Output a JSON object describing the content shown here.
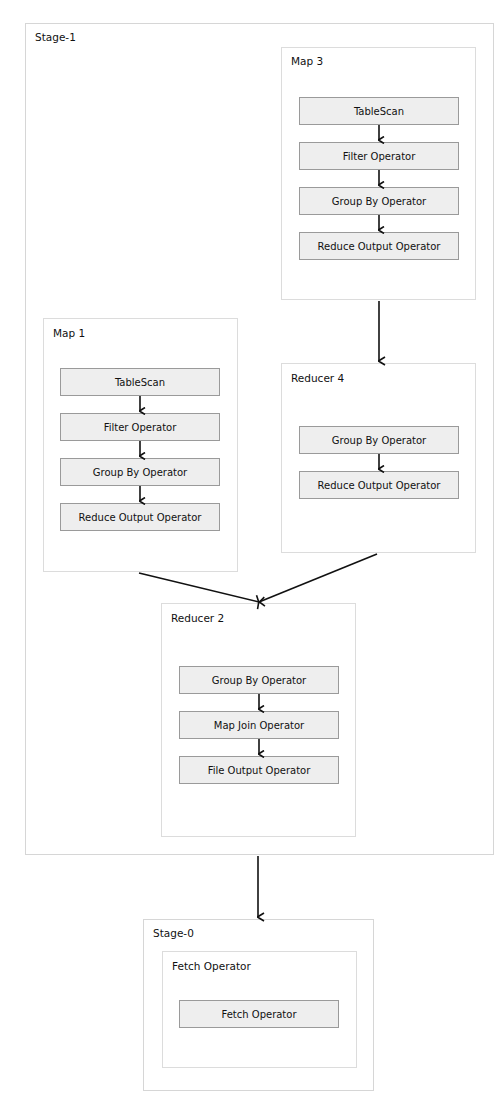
{
  "stages": {
    "stage1": {
      "label": "Stage-1",
      "vertices": {
        "map3": {
          "label": "Map 3",
          "operators": [
            "TableScan",
            "Filter Operator",
            "Group By Operator",
            "Reduce Output Operator"
          ]
        },
        "map1": {
          "label": "Map 1",
          "operators": [
            "TableScan",
            "Filter Operator",
            "Group By Operator",
            "Reduce Output Operator"
          ]
        },
        "reducer4": {
          "label": "Reducer 4",
          "operators": [
            "Group By Operator",
            "Reduce Output Operator"
          ]
        },
        "reducer2": {
          "label": "Reducer 2",
          "operators": [
            "Group By Operator",
            "Map Join Operator",
            "File Output Operator"
          ]
        }
      }
    },
    "stage0": {
      "label": "Stage-0",
      "vertices": {
        "fetch": {
          "label": "Fetch Operator",
          "operators": [
            "Fetch Operator"
          ]
        }
      }
    }
  },
  "edges": [
    {
      "from": "Map 3",
      "to": "Reducer 4"
    },
    {
      "from": "Map 1",
      "to": "Reducer 2"
    },
    {
      "from": "Reducer 4",
      "to": "Reducer 2"
    },
    {
      "from": "Stage-1",
      "to": "Stage-0"
    }
  ],
  "colors": {
    "operator_fill": "#eeeeee",
    "operator_border": "#9a9a9a",
    "container_border": "#dcdcdc",
    "edge": "#111111"
  }
}
